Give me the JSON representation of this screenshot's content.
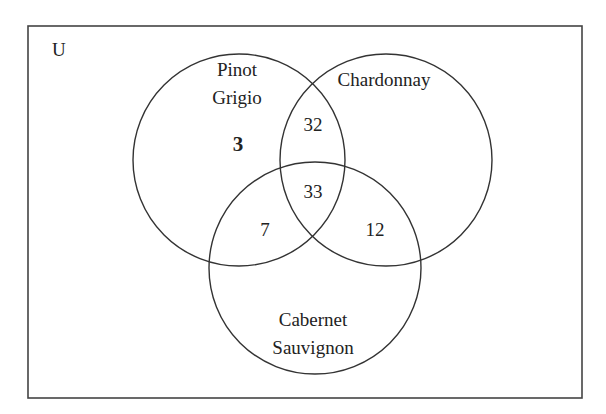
{
  "diagram": {
    "type": "venn",
    "universe_label": "U",
    "sets": [
      {
        "name": "Pinot Grigio",
        "label_lines": [
          "Pinot",
          "Grigio"
        ]
      },
      {
        "name": "Chardonnay",
        "label_lines": [
          "Chardonnay"
        ]
      },
      {
        "name": "Cabernet Sauvignon",
        "label_lines": [
          "Cabernet",
          "Sauvignon"
        ]
      }
    ],
    "regions": {
      "pinot_only": "3",
      "pinot_chardonnay_only": "32",
      "all_three": "33",
      "pinot_cabernet_only": "7",
      "chardonnay_cabernet_only": "12"
    },
    "colors": {
      "stroke": "#333333",
      "text": "#222222",
      "background": "#ffffff"
    }
  }
}
